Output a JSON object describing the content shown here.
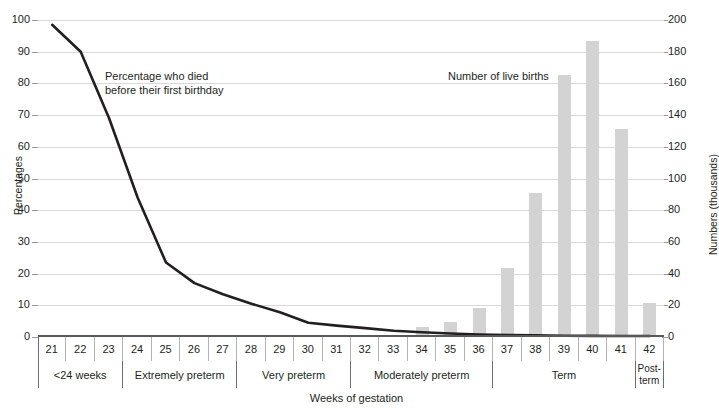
{
  "chart_data": {
    "type": "bar",
    "title": "",
    "xlabel": "Weeks of gestation",
    "ylabel_left": "Percentages",
    "ylabel_right": "Numbers (thousands)",
    "categories": [
      "21",
      "22",
      "23",
      "24",
      "25",
      "26",
      "27",
      "28",
      "29",
      "30",
      "31",
      "32",
      "33",
      "34",
      "35",
      "36",
      "37",
      "38",
      "39",
      "40",
      "41",
      "42"
    ],
    "ylim_left": [
      0,
      100
    ],
    "ylim_right": [
      0,
      200
    ],
    "yticks_left": [
      "0",
      "10",
      "20",
      "30",
      "40",
      "50",
      "60",
      "70",
      "80",
      "90",
      "100"
    ],
    "yticks_right": [
      "0",
      "20",
      "40",
      "60",
      "80",
      "100",
      "120",
      "140",
      "160",
      "180",
      "200"
    ],
    "grid": true,
    "legend_position": "inline-annotation",
    "series": [
      {
        "name": "Number of live births",
        "type": "bar",
        "axis": "right",
        "units": "thousands",
        "color": "#d3d3d3",
        "values": [
          0,
          0,
          0,
          0,
          0,
          0,
          0,
          0,
          0,
          0,
          0,
          0.4,
          0.9,
          6.3,
          9.5,
          18.5,
          43.5,
          91,
          165,
          187,
          131,
          21.5
        ]
      },
      {
        "name": "Percentage who died before their first birthday",
        "type": "line",
        "axis": "left",
        "units": "percent",
        "color": "#231f20",
        "values": [
          98.5,
          90,
          69,
          44,
          23.5,
          17,
          13.5,
          10.5,
          7.8,
          4.5,
          3.6,
          2.8,
          2.0,
          1.5,
          1.1,
          0.8,
          0.6,
          0.5,
          0.4,
          0.35,
          0.3,
          0.3
        ]
      }
    ],
    "annotations": [
      {
        "name": "line-annotation",
        "text": "Percentage who died\nbefore their first birthday"
      },
      {
        "name": "bar-annotation",
        "text": "Number of live births"
      }
    ],
    "groups": [
      {
        "label": "<24 weeks",
        "weeks": [
          "21",
          "22",
          "23"
        ]
      },
      {
        "label": "Extremely preterm",
        "weeks": [
          "24",
          "25",
          "26",
          "27"
        ]
      },
      {
        "label": "Very preterm",
        "weeks": [
          "28",
          "29",
          "30",
          "31"
        ]
      },
      {
        "label": "Moderately preterm",
        "weeks": [
          "32",
          "33",
          "34",
          "35",
          "36"
        ]
      },
      {
        "label": "Term",
        "weeks": [
          "37",
          "38",
          "39",
          "40",
          "41"
        ]
      },
      {
        "label": "Post-\nterm",
        "weeks": [
          "42"
        ]
      }
    ]
  }
}
